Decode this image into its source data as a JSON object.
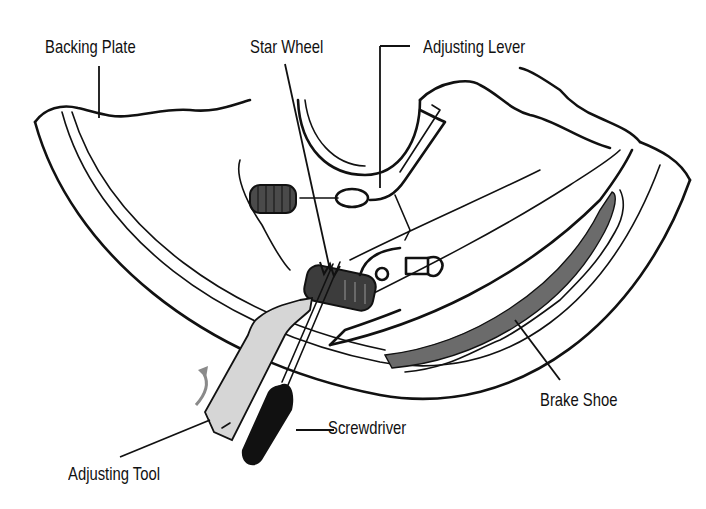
{
  "diagram": {
    "labels": {
      "backing_plate": "Backing Plate",
      "star_wheel": "Star Wheel",
      "adjusting_lever": "Adjusting Lever",
      "brake_shoe": "Brake Shoe",
      "screwdriver": "Screwdriver",
      "adjusting_tool": "Adjusting Tool"
    },
    "colors": {
      "ink": "#111111",
      "lining_gray": "#6b6b6b",
      "tool_fill": "#d6d6d6",
      "arrow_gray": "#8a8a8a",
      "spring_gray": "#4a4a4a",
      "background": "#ffffff"
    }
  }
}
